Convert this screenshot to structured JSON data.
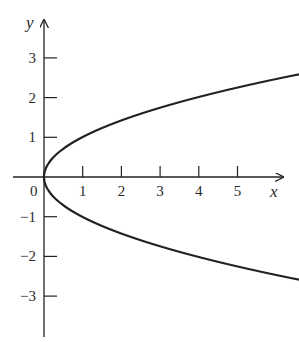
{
  "chart_data": {
    "type": "line",
    "title": "",
    "equation": "x = y^2",
    "xlabel": "x",
    "ylabel": "y",
    "xlim": [
      -0.9,
      6.2
    ],
    "ylim": [
      -4.0,
      3.6
    ],
    "x_ticks": [
      1,
      2,
      3,
      4,
      5
    ],
    "x_tick_labels": [
      "1",
      "2",
      "3",
      "4",
      "5"
    ],
    "y_ticks": [
      3,
      2,
      1,
      -1,
      -2,
      -3
    ],
    "y_tick_labels": [
      "3",
      "2",
      "1",
      "−1",
      "−2",
      "−3"
    ],
    "origin_label": "0",
    "grid": false,
    "legend": null,
    "series": [
      {
        "name": "x = y^2",
        "color": "#222222",
        "points": [
          {
            "x": 5.9,
            "y": 3.4
          },
          {
            "x": 4.0,
            "y": 2.0
          },
          {
            "x": 2.25,
            "y": 1.5
          },
          {
            "x": 1.0,
            "y": 1.0
          },
          {
            "x": 0.25,
            "y": 0.5
          },
          {
            "x": 0.0,
            "y": 0.0
          },
          {
            "x": 0.25,
            "y": -0.5
          },
          {
            "x": 1.0,
            "y": -1.0
          },
          {
            "x": 2.25,
            "y": -1.5
          },
          {
            "x": 4.0,
            "y": -2.0
          },
          {
            "x": 5.9,
            "y": -3.4
          }
        ],
        "arrows_at_ends": true
      }
    ]
  },
  "colors": {
    "ink": "#222222",
    "background": "#ffffff"
  }
}
